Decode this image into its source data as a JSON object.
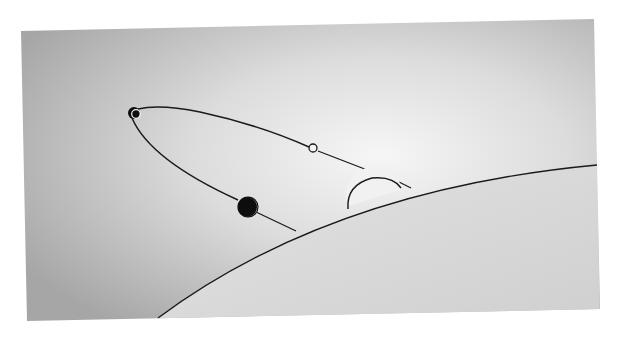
{
  "figure": {
    "colors": {
      "page_background": "#ffffff",
      "panel_dark": "#a9a9a9",
      "panel_light": "#f4f4f4",
      "planet_fill": "#d9d9d9",
      "line": "#1a1a1a",
      "body_dark": "#0d0d0d",
      "body_light": "#f2f2f2"
    },
    "panel": {
      "corners": [
        [
          21,
          31
        ],
        [
          594,
          19
        ],
        [
          600,
          309
        ],
        [
          27,
          321
        ]
      ]
    },
    "planet": {
      "horizon_start": [
        158,
        318
      ],
      "horizon_control": [
        330,
        190
      ],
      "horizon_end": [
        597,
        165
      ]
    },
    "orbit": {
      "apex_body": {
        "cx": 134,
        "cy": 113,
        "r": 6
      },
      "midpoint_marker": {
        "cx": 313,
        "cy": 148,
        "r": 4
      },
      "crescent_body": {
        "cx": 247,
        "cy": 207,
        "r": 9
      },
      "dome": {
        "cx": 374,
        "cy": 200,
        "r": 27
      }
    }
  }
}
